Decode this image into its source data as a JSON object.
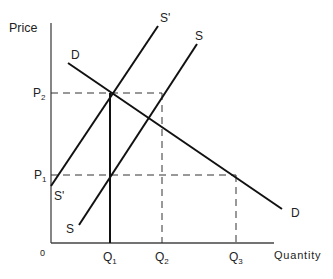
{
  "diagram": {
    "type": "supply-demand",
    "axes": {
      "y_label": "Price",
      "x_label": "Quantity",
      "origin_label": "0"
    },
    "price_levels": [
      {
        "id": "P2",
        "main": "P",
        "sub": "2"
      },
      {
        "id": "P1",
        "main": "P",
        "sub": "1"
      }
    ],
    "quantity_levels": [
      {
        "id": "Q1",
        "main": "Q",
        "sub": "1"
      },
      {
        "id": "Q2",
        "main": "Q",
        "sub": "2"
      },
      {
        "id": "Q3",
        "main": "Q",
        "sub": "3"
      }
    ],
    "curves": {
      "demand": {
        "top_label": "D",
        "bottom_label": "D"
      },
      "supply": {
        "top_label": "S",
        "bottom_label": "S"
      },
      "supply_shifted": {
        "top_label": "S'",
        "bottom_label": "S'"
      }
    },
    "colors": {
      "line": "#111111",
      "text": "#222222",
      "background": "#ffffff"
    }
  }
}
